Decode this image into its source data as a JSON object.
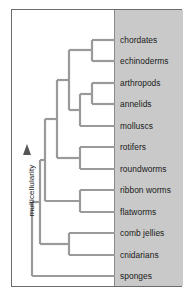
{
  "figure": {
    "type": "cladogram",
    "axis": {
      "label": "multicellularity",
      "arrow_icon": "up-triangle-icon",
      "direction": "up"
    },
    "colors": {
      "panel": "#c9c9c9",
      "branch": "#9a9a9a",
      "frame": "#6b6b6b",
      "text": "#1a1a1a"
    },
    "taxa": [
      {
        "label": "chordates",
        "y": 30
      },
      {
        "label": "echinoderms",
        "y": 51
      },
      {
        "label": "arthropods",
        "y": 73
      },
      {
        "label": "annelids",
        "y": 94
      },
      {
        "label": "molluscs",
        "y": 116
      },
      {
        "label": "rotifers",
        "y": 137
      },
      {
        "label": "roundworms",
        "y": 159
      },
      {
        "label": "ribbon worms",
        "y": 180
      },
      {
        "label": "flatworms",
        "y": 202
      },
      {
        "label": "comb jellies",
        "y": 223
      },
      {
        "label": "cnidarians",
        "y": 245
      },
      {
        "label": "sponges",
        "y": 266
      }
    ],
    "tip_line_x_start": 88,
    "tip_line_x_end": 103,
    "nodes": [
      {
        "name": "chordates-echinoderms-node",
        "x": 80,
        "y_top": 30,
        "y_bottom": 51
      },
      {
        "name": "arthropods-annelids-node",
        "x": 80,
        "y_top": 73,
        "y_bottom": 94
      },
      {
        "name": "arthropods-annelids-molluscs-node",
        "x": 68,
        "y_top": 84,
        "y_bottom": 116
      },
      {
        "name": "deuterostome-protostome-node",
        "x": 57,
        "y_top": 40,
        "y_bottom": 100
      },
      {
        "name": "rotifers-roundworms-node",
        "x": 68,
        "y_top": 137,
        "y_bottom": 159
      },
      {
        "name": "bilateria-upper-node",
        "x": 45,
        "y_top": 70,
        "y_bottom": 148
      },
      {
        "name": "ribbon-flatworms-node",
        "x": 68,
        "y_top": 180,
        "y_bottom": 202
      },
      {
        "name": "bilateria-node",
        "x": 33,
        "y_top": 109,
        "y_bottom": 191
      },
      {
        "name": "comb-cnidarians-node",
        "x": 57,
        "y_top": 223,
        "y_bottom": 245
      },
      {
        "name": "eumetazoa-node",
        "x": 28,
        "y_top": 150,
        "y_bottom": 234
      },
      {
        "name": "root-node",
        "x": 20,
        "y_top": 192,
        "y_bottom": 266
      }
    ]
  }
}
